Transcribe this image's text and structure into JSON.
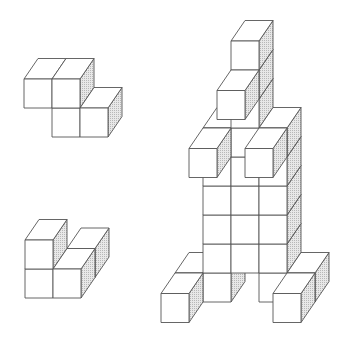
{
  "cube": {
    "width": 28,
    "height": 29,
    "depth_dx": 14,
    "depth_dy": -20.5
  },
  "colors": {
    "background": "#ffffff",
    "stroke": "#555555",
    "face": "#ffffff",
    "shade": "#e6e6e6",
    "shade_dot": "#b0b0b0"
  },
  "figures": [
    {
      "name": "figure-small-top-left",
      "origin": [
        24,
        137
      ],
      "cubes": [
        [
          1,
          0,
          0
        ],
        [
          2,
          0,
          0
        ],
        [
          0,
          1,
          0
        ],
        [
          1,
          1,
          0
        ]
      ]
    },
    {
      "name": "figure-small-bottom-left",
      "origin": [
        25,
        298
      ],
      "cubes": [
        [
          1,
          0,
          1
        ],
        [
          0,
          0,
          0
        ],
        [
          1,
          0,
          0
        ],
        [
          0,
          1,
          0
        ]
      ]
    },
    {
      "name": "figure-large-right",
      "origin": [
        203,
        302
      ],
      "cubes": [
        [
          -1,
          0,
          0
        ],
        [
          3,
          0,
          0
        ],
        [
          1,
          6,
          0
        ],
        [
          1,
          7,
          0
        ],
        [
          1,
          8,
          0
        ],
        [
          0,
          0,
          0
        ],
        [
          2,
          0,
          0
        ],
        [
          0,
          1,
          0
        ],
        [
          1,
          1,
          0
        ],
        [
          2,
          1,
          0
        ],
        [
          0,
          2,
          0
        ],
        [
          1,
          2,
          0
        ],
        [
          2,
          2,
          0
        ],
        [
          0,
          3,
          0
        ],
        [
          1,
          3,
          0
        ],
        [
          2,
          3,
          0
        ],
        [
          0,
          4,
          0
        ],
        [
          1,
          4,
          0
        ],
        [
          2,
          4,
          0
        ],
        [
          0,
          5,
          0
        ],
        [
          1,
          5,
          0
        ],
        [
          2,
          5,
          0
        ],
        [
          -1,
          0,
          -1
        ],
        [
          3,
          0,
          -1
        ],
        [
          0,
          5,
          -1
        ],
        [
          2,
          5,
          -1
        ],
        [
          1,
          7,
          -1
        ]
      ]
    }
  ]
}
